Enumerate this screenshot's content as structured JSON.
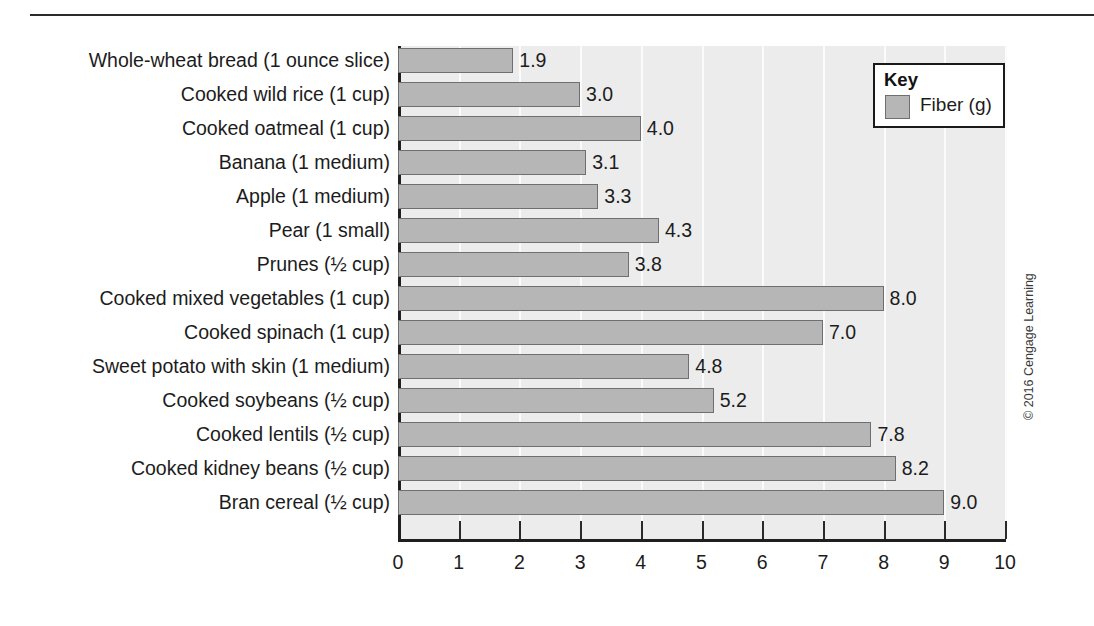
{
  "chart_data": {
    "type": "bar",
    "orientation": "horizontal",
    "title": "",
    "xlabel": "",
    "ylabel": "",
    "xlim": [
      0,
      10
    ],
    "xticks": [
      "0",
      "1",
      "2",
      "3",
      "4",
      "5",
      "6",
      "7",
      "8",
      "9",
      "10"
    ],
    "grid": true,
    "legend_position": "top-right",
    "categories": [
      "Whole-wheat bread (1 ounce slice)",
      "Cooked wild rice (1 cup)",
      "Cooked oatmeal (1 cup)",
      "Banana (1 medium)",
      "Apple (1 medium)",
      "Pear (1 small)",
      "Prunes (½ cup)",
      "Cooked mixed vegetables (1 cup)",
      "Cooked spinach (1 cup)",
      "Sweet potato with skin (1 medium)",
      "Cooked soybeans (½ cup)",
      "Cooked lentils (½ cup)",
      "Cooked kidney beans (½ cup)",
      "Bran cereal (½ cup)"
    ],
    "values": [
      1.9,
      3.0,
      4.0,
      3.1,
      3.3,
      4.3,
      3.8,
      8.0,
      7.0,
      4.8,
      5.2,
      7.8,
      8.2,
      9.0
    ],
    "value_labels": [
      "1.9",
      "3.0",
      "4.0",
      "3.1",
      "3.3",
      "4.3",
      "3.8",
      "8.0",
      "7.0",
      "4.8",
      "5.2",
      "7.8",
      "8.2",
      "9.0"
    ],
    "series": [
      {
        "name": "Fiber (g)",
        "values": [
          1.9,
          3.0,
          4.0,
          3.1,
          3.3,
          4.3,
          3.8,
          8.0,
          7.0,
          4.8,
          5.2,
          7.8,
          8.2,
          9.0
        ]
      }
    ],
    "colors": {
      "bar_fill": "#b6b6b6",
      "bar_border": "#6f6f6f",
      "plot_background": "#ececed",
      "gridline": "#fbfbfb",
      "axis": "#1f1f1f"
    }
  },
  "legend": {
    "title": "Key",
    "entries": [
      {
        "label": "Fiber (g)",
        "color": "#b6b6b6"
      }
    ]
  },
  "footer": {
    "copyright": "© 2016 Cengage Learning"
  }
}
